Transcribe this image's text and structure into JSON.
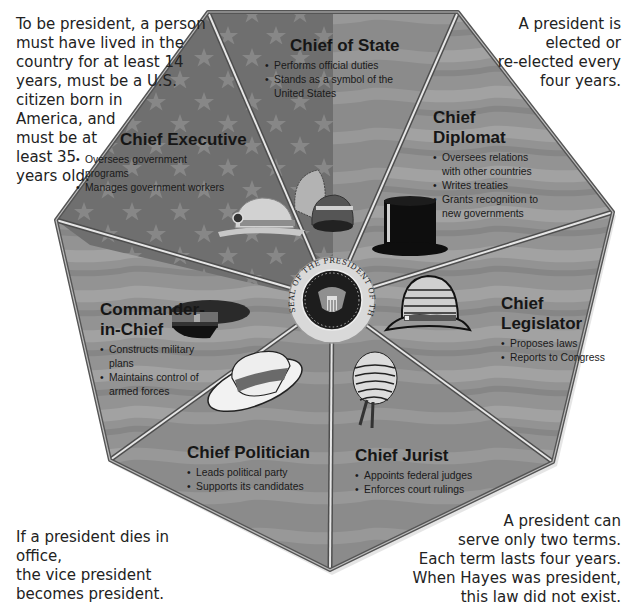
{
  "notes": {
    "top_left": [
      "To be president, a person",
      "must have lived in the",
      "country for at least 14",
      "years, must be a U.S.",
      "citizen born in",
      "America, and",
      "must be at",
      "least 35",
      "years old."
    ],
    "top_right": [
      "A president is",
      "elected or",
      "re-elected every",
      "four years."
    ],
    "bottom_left": [
      "If a president dies in office,",
      "the vice president",
      "becomes president."
    ],
    "bottom_right": [
      "A president can",
      "serve only two terms.",
      "Each term lasts four years.",
      "When Hayes was president,",
      "this law did not exist."
    ]
  },
  "seal": {
    "text": "SEAL OF THE PRESIDENT OF THE UNITED STATES",
    "icon": "presidential-seal-icon"
  },
  "colors": {
    "panel_dark": "#6e6e6e",
    "panel_mid": "#8a8a8a",
    "panel_light": "#9c9c9c",
    "divider": "#d8d8d8",
    "star": "#8d8d8d",
    "frame": "#5a5a5a"
  },
  "roles": [
    {
      "id": "state",
      "title": "Chief of State",
      "hat": "feathered-helmet-icon",
      "bullets": [
        [
          "Performs official duties"
        ],
        [
          "Stands as a symbol of the",
          "United States"
        ]
      ]
    },
    {
      "id": "executive",
      "title": "Chief Executive",
      "hat": "hard-hat-icon",
      "bullets": [
        [
          "Oversees government",
          "programs"
        ],
        [
          "Manages government workers"
        ]
      ]
    },
    {
      "id": "diplomat",
      "title_lines": [
        "Chief",
        "Diplomat"
      ],
      "hat": "top-hat-icon",
      "bullets": [
        [
          "Oversees relations",
          "with other countries"
        ],
        [
          "Writes treaties"
        ],
        [
          "Grants recognition to",
          "new governments"
        ]
      ]
    },
    {
      "id": "legislator",
      "title_lines": [
        "Chief",
        "Legislator"
      ],
      "hat": "bowler-hat-icon",
      "bullets": [
        [
          "Proposes laws"
        ],
        [
          "Reports to Congress"
        ]
      ]
    },
    {
      "id": "commander",
      "title_lines": [
        "Commander-",
        "in-Chief"
      ],
      "hat": "military-cap-icon",
      "bullets": [
        [
          "Constructs military",
          "plans"
        ],
        [
          "Maintains control of",
          "armed forces"
        ]
      ]
    },
    {
      "id": "politician",
      "title": "Chief Politician",
      "hat": "straw-boater-hat-icon",
      "bullets": [
        [
          "Leads political party"
        ],
        [
          "Supports its candidates"
        ]
      ]
    },
    {
      "id": "jurist",
      "title": "Chief Jurist",
      "hat": "judge-wig-icon",
      "bullets": [
        [
          "Appoints federal judges"
        ],
        [
          "Enforces court rulings"
        ]
      ]
    }
  ]
}
